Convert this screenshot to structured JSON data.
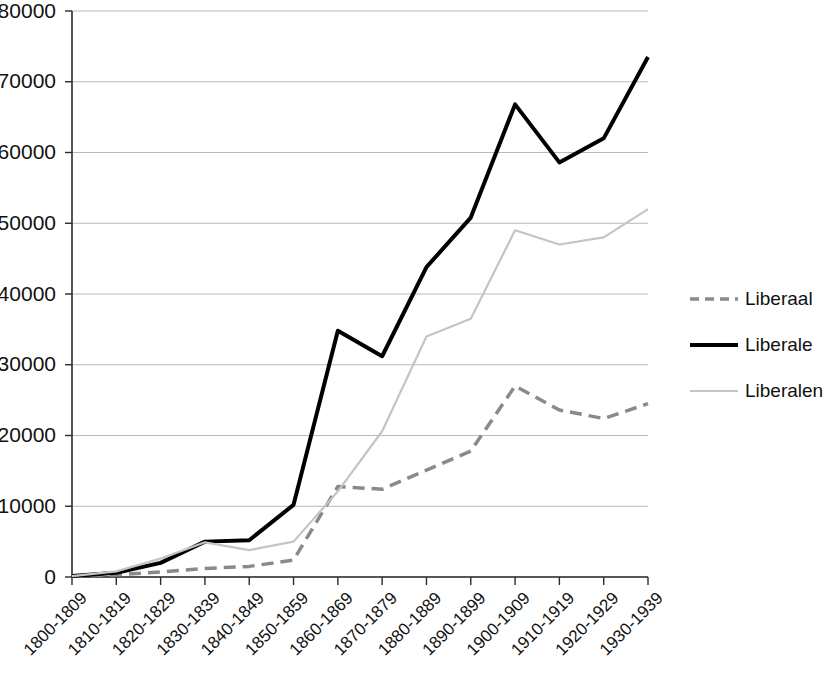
{
  "chart_data": {
    "type": "line",
    "title": "",
    "subtitle": "",
    "xlabel": "",
    "ylabel": "",
    "ylim": [
      0,
      80000
    ],
    "ytick_step": 10000,
    "yticks": [
      "0",
      "10000",
      "20000",
      "30000",
      "40000",
      "50000",
      "60000",
      "70000",
      "80000"
    ],
    "grid": true,
    "grid_axis": "y",
    "legend_position": "right",
    "categories": [
      "1800-1809",
      "1810-1819",
      "1820-1829",
      "1830-1839",
      "1840-1849",
      "1850-1859",
      "1860-1869",
      "1870-1879",
      "1880-1889",
      "1890-1899",
      "1900-1909",
      "1910-1919",
      "1920-1929",
      "1930-1939"
    ],
    "series": [
      {
        "name": "Liberaal",
        "color": "#8a8a8a",
        "style": "dashed",
        "width": 3.5,
        "values": [
          100,
          300,
          700,
          1200,
          1500,
          2400,
          12800,
          12400,
          15100,
          17800,
          27000,
          23600,
          22400,
          24500
        ]
      },
      {
        "name": "Liberale",
        "color": "#000000",
        "style": "solid",
        "width": 4.0,
        "values": [
          150,
          600,
          2000,
          5000,
          5200,
          10200,
          34800,
          31200,
          43800,
          50800,
          66800,
          58600,
          62000,
          73500
        ]
      },
      {
        "name": "Liberalen",
        "color": "#c4c4c4",
        "style": "solid",
        "width": 2.2,
        "values": [
          120,
          800,
          2600,
          4900,
          3800,
          5000,
          12100,
          20600,
          34000,
          36500,
          49000,
          47000,
          48000,
          52000
        ]
      }
    ]
  },
  "legend": {
    "items": [
      {
        "label": "Liberaal"
      },
      {
        "label": "Liberale"
      },
      {
        "label": "Liberalen"
      }
    ]
  },
  "axes": {
    "y_min_label": "0",
    "y_max_label": "80000"
  }
}
